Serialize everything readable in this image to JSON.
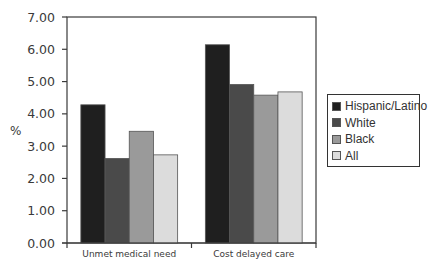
{
  "chart_data": {
    "type": "bar",
    "title": "",
    "xlabel": "",
    "ylabel": "%",
    "ylim": [
      0,
      7
    ],
    "yticks": [
      "0.00",
      "1.00",
      "2.00",
      "3.00",
      "4.00",
      "5.00",
      "6.00",
      "7.00"
    ],
    "categories": [
      "Unmet medical need",
      "Cost delayed care"
    ],
    "series": [
      {
        "name": "Hispanic/Latino",
        "color": "#1f1f1f",
        "values": [
          4.28,
          6.14
        ]
      },
      {
        "name": "White",
        "color": "#4a4a4a",
        "values": [
          2.62,
          4.91
        ]
      },
      {
        "name": "Black",
        "color": "#9a9a9a",
        "values": [
          3.46,
          4.58
        ]
      },
      {
        "name": "All",
        "color": "#dcdcdc",
        "values": [
          2.73,
          4.68
        ]
      }
    ],
    "grid": false,
    "legend_position": "right"
  }
}
